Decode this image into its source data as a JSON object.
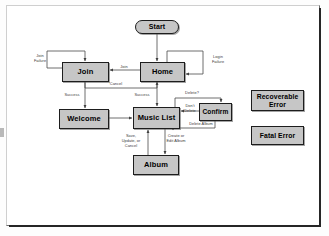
{
  "diagram": {
    "type": "state-flow-diagram",
    "colors": {
      "node_fill": "#c6c6c6",
      "node_border": "#1d1d1d",
      "edge": "#4a4a4a",
      "label_text": "#3a3a3a",
      "page_background": "#ffffff"
    },
    "nodes": [
      {
        "id": "start",
        "label": "Start",
        "shape": "stadium",
        "x": 128,
        "y": 14,
        "w": 44,
        "h": 14
      },
      {
        "id": "join",
        "label": "Join",
        "shape": "rectangle",
        "x": 55,
        "y": 56,
        "w": 47,
        "h": 20
      },
      {
        "id": "home",
        "label": "Home",
        "shape": "rectangle",
        "x": 133,
        "y": 56,
        "w": 45,
        "h": 20
      },
      {
        "id": "welcome",
        "label": "Welcome",
        "shape": "rectangle",
        "x": 52,
        "y": 103,
        "w": 50,
        "h": 20
      },
      {
        "id": "music-list",
        "label": "Music List",
        "shape": "rectangle",
        "x": 126,
        "y": 101,
        "w": 47,
        "h": 22
      },
      {
        "id": "confirm",
        "label": "Confirm",
        "shape": "rectangle",
        "x": 192,
        "y": 97,
        "w": 33,
        "h": 18
      },
      {
        "id": "album",
        "label": "Album",
        "shape": "rectangle",
        "x": 126,
        "y": 149,
        "w": 46,
        "h": 20
      },
      {
        "id": "recoverable",
        "label": "Recoverable\nError",
        "shape": "rectangle",
        "x": 244,
        "y": 84,
        "w": 53,
        "h": 21
      },
      {
        "id": "fatal",
        "label": "Fatal Error",
        "shape": "rectangle",
        "x": 244,
        "y": 120,
        "w": 53,
        "h": 19
      }
    ],
    "edges": [
      {
        "id": "start-home",
        "from": "start",
        "to": "home",
        "label": ""
      },
      {
        "id": "join-join-failure",
        "from": "join",
        "to": "join",
        "label": "Join\nFailure"
      },
      {
        "id": "home-login-failure",
        "from": "home",
        "to": "home",
        "label": "Login\nFailure"
      },
      {
        "id": "home-join",
        "from": "home",
        "to": "join",
        "label": "Join"
      },
      {
        "id": "join-home-cancel",
        "from": "join",
        "to": "home",
        "label": "Cancel"
      },
      {
        "id": "join-welcome",
        "from": "join",
        "to": "welcome",
        "label": "Success"
      },
      {
        "id": "home-music-list",
        "from": "home",
        "to": "music-list",
        "label": "Success"
      },
      {
        "id": "welcome-music-list",
        "from": "welcome",
        "to": "music-list",
        "label": ""
      },
      {
        "id": "music-list-confirm",
        "from": "music-list",
        "to": "confirm",
        "label": "Delete?"
      },
      {
        "id": "confirm-music-list",
        "from": "confirm",
        "to": "music-list",
        "label": "Don't\nDelete"
      },
      {
        "id": "confirm-delete-album",
        "from": "confirm",
        "to": "music-list",
        "label": "Delete Album"
      },
      {
        "id": "music-list-album",
        "from": "music-list",
        "to": "album",
        "label": "Create or\nEdit Album"
      },
      {
        "id": "album-music-list",
        "from": "album",
        "to": "music-list",
        "label": "Save,\nUpdate, or\nCancel"
      }
    ],
    "legend": [
      {
        "id": "recoverable",
        "label": "Recoverable Error"
      },
      {
        "id": "fatal",
        "label": "Fatal Error"
      }
    ]
  }
}
